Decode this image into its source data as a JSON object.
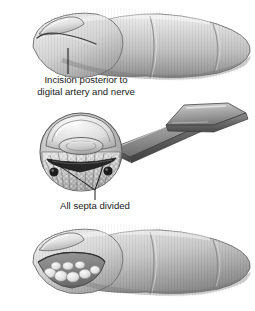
{
  "figure": {
    "background_color": "#ffffff",
    "ink_color": "#1a1a1a",
    "skin_light": "#e6e6e6",
    "skin_mid": "#c2c2c2",
    "skin_dark": "#8e8e8e",
    "skin_shadow": "#6f6f6f",
    "steel_light": "#d2d2d2",
    "steel_mid": "#9a9a9a",
    "steel_dark": "#5e5e5e",
    "pulp_light": "#efefef",
    "pulp_mid": "#b9b9b9",
    "incision_color": "#2a2a2a",
    "bundle_color": "#1d1d1d"
  },
  "panels": [
    {
      "id": "top-finger",
      "name": "lateral-finger-with-incision",
      "label": {
        "line1": "Incision posterior to",
        "line2": "digital artery and nerve",
        "x": 86,
        "line1_y": 83,
        "line2_y": 95,
        "leader": {
          "x": 68,
          "y1": 48,
          "y2": 74
        }
      }
    },
    {
      "id": "mid-crosssection",
      "name": "fingertip-cross-section-with-scalpel",
      "label": {
        "line1": "All septa divided",
        "x": 95,
        "line1_y": 209,
        "leader": {
          "stem_x": 95,
          "stem_y1": 190,
          "stem_y2": 200,
          "left_x": 61,
          "left_y": 167,
          "right_x": 103,
          "right_y": 166
        }
      }
    },
    {
      "id": "bottom-finger",
      "name": "lateral-finger-incision-opened",
      "label": null
    }
  ],
  "annotations": {
    "incision_label_full": "Incision posterior to digital artery and nerve",
    "septa_label_full": "All septa divided"
  }
}
